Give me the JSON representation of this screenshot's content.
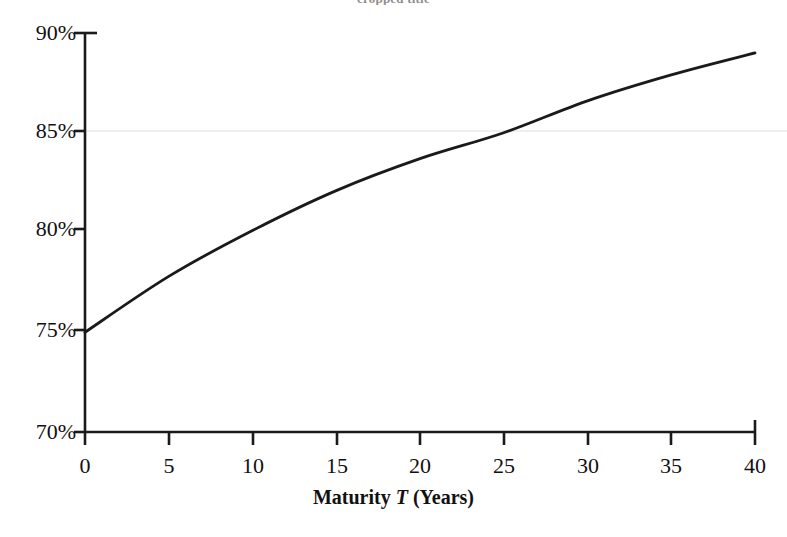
{
  "chart_data": {
    "type": "line",
    "title": "",
    "xlabel": "Maturity T (Years)",
    "ylabel": "",
    "x": [
      0,
      5,
      10,
      15,
      20,
      25,
      30,
      35,
      40
    ],
    "values": [
      75.0,
      77.8,
      80.1,
      82.1,
      83.7,
      85.0,
      86.6,
      87.9,
      89.0
    ],
    "series": [
      {
        "name": "curve",
        "values": [
          75.0,
          77.8,
          80.1,
          82.1,
          83.7,
          85.0,
          86.6,
          87.9,
          89.0
        ]
      }
    ],
    "categories": [
      "0",
      "5",
      "10",
      "15",
      "20",
      "25",
      "30",
      "35",
      "40"
    ],
    "xlim": [
      0,
      40
    ],
    "ylim": [
      70,
      90
    ],
    "xticks": [
      0,
      5,
      10,
      15,
      20,
      25,
      30,
      35,
      40
    ],
    "yticks": [
      70,
      75,
      80,
      85,
      90
    ],
    "xticklabels": [
      "0",
      "5",
      "10",
      "15",
      "20",
      "25",
      "30",
      "35",
      "40"
    ],
    "yticklabels": [
      "70%",
      "75%",
      "80%",
      "85%",
      "90%"
    ],
    "grid": "horizontal-faint-at-85",
    "gridlines_y": [
      85
    ],
    "legend": "none",
    "line_color": "#1a1a1a",
    "axis_color": "#1a1a1a",
    "grid_color": "#eeeeee",
    "background": "#ffffff"
  },
  "axis": {
    "x_title_main": "Maturity",
    "x_title_symbol": "T",
    "x_title_unit": "(Years)"
  },
  "labels": {
    "y": [
      "90%",
      "85%",
      "80%",
      "75%",
      "70%"
    ],
    "x": [
      "0",
      "5",
      "10",
      "15",
      "20",
      "25",
      "30",
      "35",
      "40"
    ]
  },
  "title_partial": "cropped title"
}
